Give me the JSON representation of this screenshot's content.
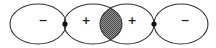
{
  "diagram": {
    "colors": {
      "stroke": "#333333",
      "background": "#ffffff",
      "hatch": "#555555",
      "node": "#111111"
    },
    "lobes": [
      {
        "id": "lobe-1",
        "sign": "−",
        "cx": 38,
        "cy": 24,
        "rx": 28,
        "ry": 20
      },
      {
        "id": "lobe-2",
        "sign": "+",
        "cx": 93,
        "cy": 24,
        "rx": 29,
        "ry": 20
      },
      {
        "id": "lobe-3",
        "sign": "+",
        "cx": 127,
        "cy": 24,
        "rx": 27,
        "ry": 20
      },
      {
        "id": "lobe-4",
        "sign": "−",
        "cx": 181,
        "cy": 24,
        "rx": 27,
        "ry": 20
      }
    ],
    "nuclei": [
      {
        "id": "nucleus-left",
        "cx": 65,
        "cy": 24,
        "r": 2.6
      },
      {
        "id": "nucleus-right",
        "cx": 154,
        "cy": 24,
        "r": 2.6
      }
    ],
    "overlap_region": {
      "label": "bonding overlap",
      "fill": "hatched"
    }
  }
}
